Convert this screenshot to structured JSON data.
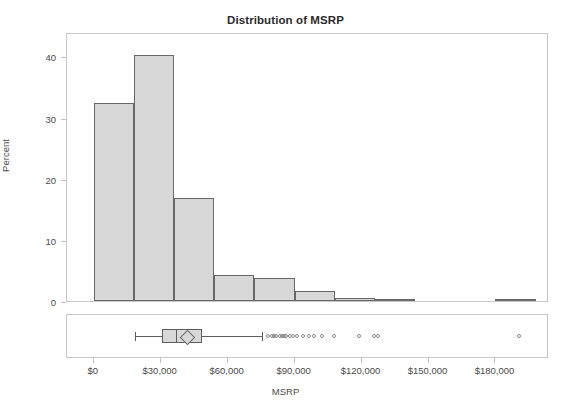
{
  "chart_data": {
    "type": "bar",
    "title": "Distribution of MSRP",
    "xlabel": "MSRP",
    "ylabel": "Percent",
    "grid": false,
    "legend": "none",
    "xlim": [
      -12000,
      204000
    ],
    "ylim": [
      0,
      44
    ],
    "xticks": [
      0,
      30000,
      60000,
      90000,
      120000,
      150000,
      180000
    ],
    "xtick_labels": [
      "$0",
      "$30,000",
      "$60,000",
      "$90,000",
      "$120,000",
      "$150,000",
      "$180,000"
    ],
    "yticks": [
      0,
      10,
      20,
      30,
      40
    ],
    "ytick_labels": [
      "0",
      "10",
      "20",
      "30",
      "40"
    ],
    "bin_width": 18000,
    "categories": [
      "0-18,000",
      "18,000-36,000",
      "36,000-54,000",
      "54,000-72,000",
      "72,000-90,000",
      "90,000-108,000",
      "108,000-126,000",
      "126,000-144,000",
      "144,000-162,000",
      "162,000-180,000",
      "180,000-198,000"
    ],
    "bin_starts": [
      0,
      18000,
      36000,
      54000,
      72000,
      90000,
      108000,
      126000,
      144000,
      162000,
      180000
    ],
    "values": [
      32.4,
      40.2,
      16.8,
      4.2,
      3.7,
      1.7,
      0.45,
      0.25,
      0,
      0,
      0.25
    ],
    "bars": [
      {
        "bin_start": 0,
        "bin_end": 18000,
        "percent": 32.4
      },
      {
        "bin_start": 18000,
        "bin_end": 36000,
        "percent": 40.2
      },
      {
        "bin_start": 36000,
        "bin_end": 54000,
        "percent": 16.8
      },
      {
        "bin_start": 54000,
        "bin_end": 72000,
        "percent": 4.2
      },
      {
        "bin_start": 72000,
        "bin_end": 90000,
        "percent": 3.7
      },
      {
        "bin_start": 90000,
        "bin_end": 108000,
        "percent": 1.7
      },
      {
        "bin_start": 108000,
        "bin_end": 126000,
        "percent": 0.45
      },
      {
        "bin_start": 126000,
        "bin_end": 144000,
        "percent": 0.25
      },
      {
        "bin_start": 180000,
        "bin_end": 198000,
        "percent": 0.25
      }
    ],
    "bar_fill_color": "#d8d8d8",
    "bar_border_color": "#686868",
    "boxplot": {
      "orientation": "horizontal",
      "whisker_low": 18500,
      "q1": 30500,
      "median": 37000,
      "mean": 41500,
      "q3": 48500,
      "whisker_high": 75500,
      "outliers": [
        78500,
        80000,
        81000,
        82000,
        83500,
        84500,
        85500,
        86500,
        88000,
        89500,
        91500,
        94000,
        96500,
        99000,
        102500,
        108000,
        119000,
        126000,
        127500,
        191000
      ],
      "box_fill_color": "#d8d8d8",
      "box_border_color": "#5e5e5e",
      "mean_marker": "diamond",
      "outlier_marker": "open-circle"
    }
  }
}
